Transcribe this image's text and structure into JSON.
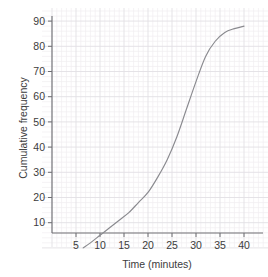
{
  "chart_data": {
    "type": "line",
    "title": "",
    "subtitle": "",
    "xlabel": "Time (minutes)",
    "ylabel": "Cumulative frequency",
    "xlim": [
      0,
      43
    ],
    "ylim": [
      0,
      92
    ],
    "xticks": [
      5,
      10,
      15,
      20,
      25,
      30,
      35,
      40
    ],
    "yticks": [
      10,
      20,
      30,
      40,
      50,
      60,
      70,
      80,
      90
    ],
    "xtick_labels": [
      "5",
      "10",
      "15",
      "20",
      "25",
      "30",
      "35",
      "40"
    ],
    "ytick_labels": [
      "10",
      "20",
      "30",
      "40",
      "50",
      "60",
      "70",
      "80",
      "90"
    ],
    "grid": true,
    "grid_minor": true,
    "legend": "none",
    "series": [
      {
        "name": "Cumulative frequency",
        "color": "#8a8a8f",
        "x": [
          6.5,
          8,
          10,
          12,
          14,
          16,
          18,
          20,
          22,
          24,
          26,
          28,
          30,
          32,
          34,
          36,
          38,
          40
        ],
        "y": [
          0,
          2,
          5,
          8,
          11,
          14,
          18,
          22,
          28,
          35,
          44,
          55,
          66,
          76,
          82,
          85.5,
          87,
          88
        ]
      }
    ],
    "annotations": []
  },
  "axes": {
    "x_title": "Time (minutes)",
    "y_title": "Cumulative frequency"
  }
}
